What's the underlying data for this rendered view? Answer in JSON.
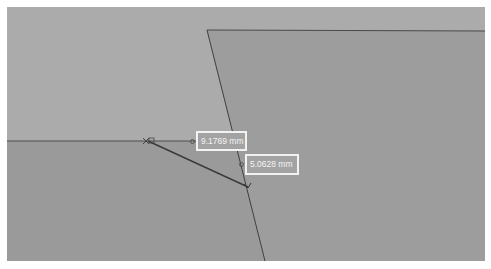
{
  "viewport": {
    "background": "#ababab",
    "lower_region_color": "#9a9a9a",
    "part_color": "#9d9d9d",
    "edge_color": "#4a4a4a"
  },
  "measurements": [
    {
      "value": "9.1769 mm"
    },
    {
      "value": "5.0628 mm"
    }
  ]
}
